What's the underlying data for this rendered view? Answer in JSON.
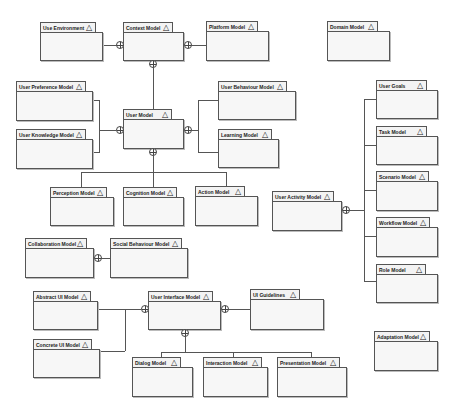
{
  "diagram": {
    "type": "UML package diagram",
    "packages": [
      {
        "id": "use-environment",
        "label": "Use Environment",
        "x": 40,
        "y": 22,
        "tabW": 56,
        "w": 63,
        "h": 38
      },
      {
        "id": "context-model",
        "label": "Context Model",
        "x": 123,
        "y": 22,
        "tabW": 50,
        "w": 61,
        "h": 38
      },
      {
        "id": "platform-model",
        "label": "Platform Model",
        "x": 206,
        "y": 21,
        "tabW": 52,
        "w": 63,
        "h": 39
      },
      {
        "id": "domain-model",
        "label": "Domain Model",
        "x": 327,
        "y": 21,
        "tabW": 51,
        "w": 63,
        "h": 39
      },
      {
        "id": "user-preference-model",
        "label": "User Preference Model",
        "x": 16,
        "y": 81,
        "tabW": 70,
        "w": 77,
        "h": 39
      },
      {
        "id": "user-knowledge-model",
        "label": "User Knowledge Model",
        "x": 16,
        "y": 129,
        "tabW": 70,
        "w": 77,
        "h": 39
      },
      {
        "id": "user-model",
        "label": "User Model",
        "x": 123,
        "y": 109,
        "tabW": 49,
        "w": 61,
        "h": 39
      },
      {
        "id": "user-behaviour-model",
        "label": "User Behaviour Model",
        "x": 218,
        "y": 81,
        "tabW": 69,
        "w": 78,
        "h": 38
      },
      {
        "id": "learning-model",
        "label": "Learning Model",
        "x": 218,
        "y": 129,
        "tabW": 54,
        "w": 61,
        "h": 38
      },
      {
        "id": "perception-model",
        "label": "Perception Model",
        "x": 50,
        "y": 187,
        "tabW": 57,
        "w": 64,
        "h": 38
      },
      {
        "id": "cognition-model",
        "label": "Cognition Model",
        "x": 123,
        "y": 187,
        "tabW": 54,
        "w": 61,
        "h": 38
      },
      {
        "id": "action-model",
        "label": "Action Model",
        "x": 195,
        "y": 186,
        "tabW": 50,
        "w": 63,
        "h": 39
      },
      {
        "id": "user-goals",
        "label": "User Goals",
        "x": 376,
        "y": 80,
        "tabW": 51,
        "w": 62,
        "h": 38
      },
      {
        "id": "task-model",
        "label": "Task Model",
        "x": 376,
        "y": 126,
        "tabW": 51,
        "w": 62,
        "h": 38
      },
      {
        "id": "scenario-model",
        "label": "Scenario Model",
        "x": 376,
        "y": 171,
        "tabW": 53,
        "w": 62,
        "h": 39
      },
      {
        "id": "workflow-model",
        "label": "Workflow Model",
        "x": 376,
        "y": 217,
        "tabW": 54,
        "w": 62,
        "h": 39
      },
      {
        "id": "role-model",
        "label": "Role Model",
        "x": 376,
        "y": 264,
        "tabW": 50,
        "w": 62,
        "h": 38
      },
      {
        "id": "user-activity-model",
        "label": "User Activity Model",
        "x": 272,
        "y": 191,
        "tabW": 62,
        "w": 70,
        "h": 39
      },
      {
        "id": "collaboration-model",
        "label": "Collaboration Model",
        "x": 25,
        "y": 238,
        "tabW": 62,
        "w": 69,
        "h": 39
      },
      {
        "id": "social-behaviour-model",
        "label": "Social Behaviour Model",
        "x": 110,
        "y": 238,
        "tabW": 72,
        "w": 78,
        "h": 39
      },
      {
        "id": "abstract-ui-model",
        "label": "Abstract UI Model",
        "x": 33,
        "y": 291,
        "tabW": 58,
        "w": 65,
        "h": 38
      },
      {
        "id": "concrete-ui-model",
        "label": "Concrete UI Model",
        "x": 33,
        "y": 339,
        "tabW": 59,
        "w": 67,
        "h": 38
      },
      {
        "id": "user-interface-model",
        "label": "User Interface Model",
        "x": 148,
        "y": 291,
        "tabW": 65,
        "w": 73,
        "h": 38
      },
      {
        "id": "ui-guidelines",
        "label": "UI Guidelines",
        "x": 250,
        "y": 289,
        "tabW": 50,
        "w": 74,
        "h": 40
      },
      {
        "id": "dialog-model",
        "label": "Dialog Model",
        "x": 132,
        "y": 357,
        "tabW": 49,
        "w": 61,
        "h": 39
      },
      {
        "id": "interaction-model",
        "label": "Interaction Model",
        "x": 203,
        "y": 357,
        "tabW": 59,
        "w": 65,
        "h": 39
      },
      {
        "id": "presentation-model",
        "label": "Presentation Model",
        "x": 277,
        "y": 357,
        "tabW": 63,
        "w": 70,
        "h": 39
      },
      {
        "id": "adaptation-model",
        "label": "Adaptation Model",
        "x": 374,
        "y": 331,
        "tabW": 56,
        "w": 64,
        "h": 39
      }
    ],
    "tab_symbol": "△",
    "lines": [
      [
        103,
        45,
        116,
        1
      ],
      [
        184,
        45,
        22,
        1
      ],
      [
        153,
        60,
        1,
        49
      ],
      [
        93,
        100,
        7,
        1
      ],
      [
        99,
        100,
        1,
        53
      ],
      [
        93,
        152,
        7,
        1
      ],
      [
        99,
        130,
        17,
        1
      ],
      [
        184,
        130,
        15,
        1
      ],
      [
        198,
        100,
        1,
        53
      ],
      [
        198,
        100,
        20,
        1
      ],
      [
        198,
        152,
        20,
        1
      ],
      [
        153,
        148,
        1,
        24
      ],
      [
        81,
        172,
        146,
        1
      ],
      [
        81,
        172,
        1,
        15
      ],
      [
        153,
        172,
        1,
        15
      ],
      [
        226,
        172,
        1,
        14
      ],
      [
        342,
        210,
        23,
        1
      ],
      [
        364,
        99,
        1,
        182
      ],
      [
        364,
        99,
        12,
        1
      ],
      [
        364,
        145,
        12,
        1
      ],
      [
        364,
        190,
        12,
        1
      ],
      [
        364,
        236,
        12,
        1
      ],
      [
        364,
        281,
        12,
        1
      ],
      [
        94,
        258,
        16,
        1
      ],
      [
        98,
        309,
        43,
        1
      ],
      [
        125,
        309,
        1,
        42
      ],
      [
        100,
        351,
        25,
        1
      ],
      [
        221,
        309,
        29,
        1
      ],
      [
        185,
        329,
        1,
        23
      ],
      [
        161,
        352,
        151,
        1
      ],
      [
        161,
        352,
        1,
        5
      ],
      [
        233,
        352,
        1,
        5
      ],
      [
        311,
        352,
        1,
        5
      ]
    ],
    "xor_nodes": [
      [
        116,
        41
      ],
      [
        184,
        41
      ],
      [
        149,
        60
      ],
      [
        116,
        126
      ],
      [
        184,
        126
      ],
      [
        149,
        148
      ],
      [
        342,
        206
      ],
      [
        94,
        254
      ],
      [
        141,
        305
      ],
      [
        221,
        305
      ],
      [
        181,
        329
      ]
    ],
    "colors": {
      "stroke": "#555555",
      "tab_fill": "#f3f3f3",
      "body_fill": "#f7f7f7",
      "background": "#ffffff"
    }
  }
}
